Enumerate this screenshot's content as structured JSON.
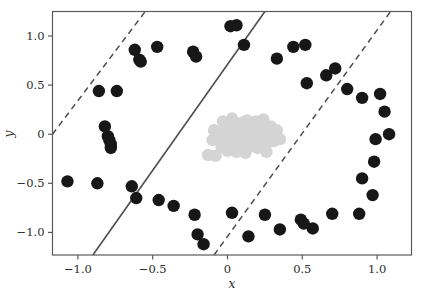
{
  "chart_data": {
    "type": "scatter",
    "title": "",
    "xlabel": "x",
    "ylabel": "y",
    "xlim": [
      -1.17,
      1.23
    ],
    "ylim": [
      -1.23,
      1.25
    ],
    "xticks": [
      -1.0,
      -0.5,
      0,
      0.5,
      1.0
    ],
    "xticklabels": [
      "−1.0",
      "−0.5",
      "0",
      "0.5",
      "1.0"
    ],
    "yticks": [
      -1.0,
      -0.5,
      0,
      0.5,
      1.0
    ],
    "yticklabels": [
      "−1.0",
      "−0.5",
      "0",
      "0.5",
      "1.0"
    ],
    "grid": false,
    "legend": null,
    "colors": {
      "outer_class": "#171717",
      "inner_class": "#d4d4d4",
      "decision_boundary": "#4d4d4d",
      "margin": "#4d4d4d",
      "axis": "#5a5a5a",
      "background": "#ffffff"
    },
    "marker": {
      "outer_radius_px": 6.2,
      "inner_radius_px": 6.2,
      "shape": "circle"
    },
    "series": [
      {
        "name": "outer-ring-class",
        "color": "#171717",
        "points": [
          [
            -1.07,
            -0.48
          ],
          [
            -0.87,
            -0.5
          ],
          [
            -0.86,
            0.44
          ],
          [
            -0.82,
            0.08
          ],
          [
            -0.8,
            -0.02
          ],
          [
            -0.79,
            -0.06
          ],
          [
            -0.78,
            -0.1
          ],
          [
            -0.78,
            -0.14
          ],
          [
            -0.74,
            0.44
          ],
          [
            -0.64,
            -0.53
          ],
          [
            -0.62,
            0.86
          ],
          [
            -0.61,
            -0.65
          ],
          [
            -0.59,
            0.76
          ],
          [
            -0.58,
            0.74
          ],
          [
            -0.47,
            0.89
          ],
          [
            -0.46,
            -0.67
          ],
          [
            -0.36,
            -0.73
          ],
          [
            -0.23,
            0.84
          ],
          [
            -0.22,
            -0.82
          ],
          [
            -0.21,
            0.79
          ],
          [
            -0.2,
            -1.02
          ],
          [
            -0.16,
            -1.12
          ],
          [
            0.02,
            1.1
          ],
          [
            0.03,
            -0.8
          ],
          [
            0.06,
            1.11
          ],
          [
            0.11,
            0.91
          ],
          [
            0.14,
            -1.04
          ],
          [
            0.25,
            -0.82
          ],
          [
            0.33,
            0.77
          ],
          [
            0.35,
            -0.97
          ],
          [
            0.44,
            0.89
          ],
          [
            0.49,
            -0.87
          ],
          [
            0.51,
            -0.91
          ],
          [
            0.52,
            0.91
          ],
          [
            0.53,
            0.52
          ],
          [
            0.57,
            -0.96
          ],
          [
            0.66,
            0.6
          ],
          [
            0.7,
            -0.81
          ],
          [
            0.72,
            0.67
          ],
          [
            0.8,
            0.46
          ],
          [
            0.88,
            -0.81
          ],
          [
            0.9,
            0.37
          ],
          [
            0.9,
            -0.45
          ],
          [
            0.97,
            -0.62
          ],
          [
            0.98,
            -0.28
          ],
          [
            0.99,
            -0.05
          ],
          [
            1.02,
            0.41
          ],
          [
            1.05,
            0.23
          ],
          [
            1.08,
            0.0
          ]
        ]
      },
      {
        "name": "inner-cluster-class",
        "color": "#d4d4d4",
        "points": [
          [
            -0.13,
            -0.21
          ],
          [
            -0.1,
            -0.06
          ],
          [
            -0.09,
            0.04
          ],
          [
            -0.07,
            -0.04
          ],
          [
            -0.05,
            0.02
          ],
          [
            -0.04,
            -0.13
          ],
          [
            -0.03,
            0.13
          ],
          [
            -0.02,
            -0.08
          ],
          [
            -0.01,
            0.07
          ],
          [
            0.0,
            -0.17
          ],
          [
            0.01,
            0.0
          ],
          [
            0.02,
            0.09
          ],
          [
            0.03,
            -0.05
          ],
          [
            0.03,
            0.16
          ],
          [
            0.04,
            -0.11
          ],
          [
            0.05,
            0.03
          ],
          [
            0.06,
            -0.02
          ],
          [
            0.06,
            0.11
          ],
          [
            0.07,
            -0.14
          ],
          [
            0.08,
            0.06
          ],
          [
            0.08,
            -0.06
          ],
          [
            0.09,
            0.01
          ],
          [
            0.1,
            0.12
          ],
          [
            0.1,
            -0.09
          ],
          [
            0.11,
            0.05
          ],
          [
            0.11,
            -0.03
          ],
          [
            0.12,
            0.09
          ],
          [
            0.12,
            -0.16
          ],
          [
            0.13,
            0.0
          ],
          [
            0.13,
            0.14
          ],
          [
            0.14,
            -0.07
          ],
          [
            0.14,
            0.04
          ],
          [
            0.15,
            -0.12
          ],
          [
            0.15,
            0.08
          ],
          [
            0.16,
            0.01
          ],
          [
            0.16,
            -0.04
          ],
          [
            0.17,
            0.11
          ],
          [
            0.17,
            -0.09
          ],
          [
            0.18,
            0.05
          ],
          [
            0.18,
            -0.01
          ],
          [
            0.19,
            0.13
          ],
          [
            0.19,
            -0.06
          ],
          [
            0.2,
            0.02
          ],
          [
            0.2,
            -0.14
          ],
          [
            0.21,
            0.07
          ],
          [
            0.21,
            -0.03
          ],
          [
            0.22,
            0.1
          ],
          [
            0.22,
            -0.08
          ],
          [
            0.23,
            0.03
          ],
          [
            0.24,
            -0.05
          ],
          [
            0.24,
            0.15
          ],
          [
            0.25,
            0.06
          ],
          [
            0.26,
            -0.1
          ],
          [
            0.27,
            0.01
          ],
          [
            0.28,
            -0.03
          ],
          [
            0.29,
            0.08
          ],
          [
            0.31,
            -0.07
          ],
          [
            0.33,
            0.04
          ],
          [
            0.35,
            -0.05
          ],
          [
            0.26,
            -0.18
          ],
          [
            0.12,
            -0.19
          ],
          [
            0.06,
            -0.18
          ],
          [
            -0.08,
            -0.22
          ]
        ]
      }
    ],
    "lines": [
      {
        "name": "decision-boundary",
        "style": "solid",
        "color": "#4d4d4d",
        "width_px": 1.6,
        "endpoints": [
          [
            -0.9,
            -1.23
          ],
          [
            0.25,
            1.25
          ]
        ]
      },
      {
        "name": "margin-lower-left",
        "style": "dashed",
        "color": "#4d4d4d",
        "width_px": 1.5,
        "endpoints": [
          [
            -1.17,
            0.0
          ],
          [
            -0.55,
            1.25
          ]
        ]
      },
      {
        "name": "margin-upper-right",
        "style": "dashed",
        "color": "#4d4d4d",
        "width_px": 1.5,
        "endpoints": [
          [
            -0.09,
            -1.23
          ],
          [
            1.09,
            1.25
          ]
        ]
      }
    ]
  },
  "axes": {
    "x_title": "x",
    "y_title": "y"
  }
}
